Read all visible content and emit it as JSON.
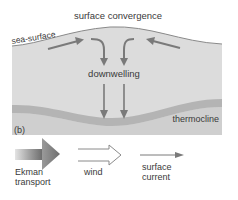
{
  "diagram": {
    "title": "surface convergence",
    "sea_surface_label": "sea-surface",
    "downwelling_label": "downwelling",
    "thermocline_label": "thermocline",
    "panel_label": "(b)"
  },
  "legend": {
    "ekman_line1": "Ekman",
    "ekman_line2": "transport",
    "wind": "wind",
    "current_line1": "surface",
    "current_line2": "current"
  },
  "colors": {
    "water": "#dcdcdc",
    "thermocline_band": "#b4b4b4",
    "below_thermocline": "#cfcfcf",
    "arrow": "#7a7a7a",
    "surface_line": "#8a8a8a",
    "text": "#3a3a3a"
  }
}
